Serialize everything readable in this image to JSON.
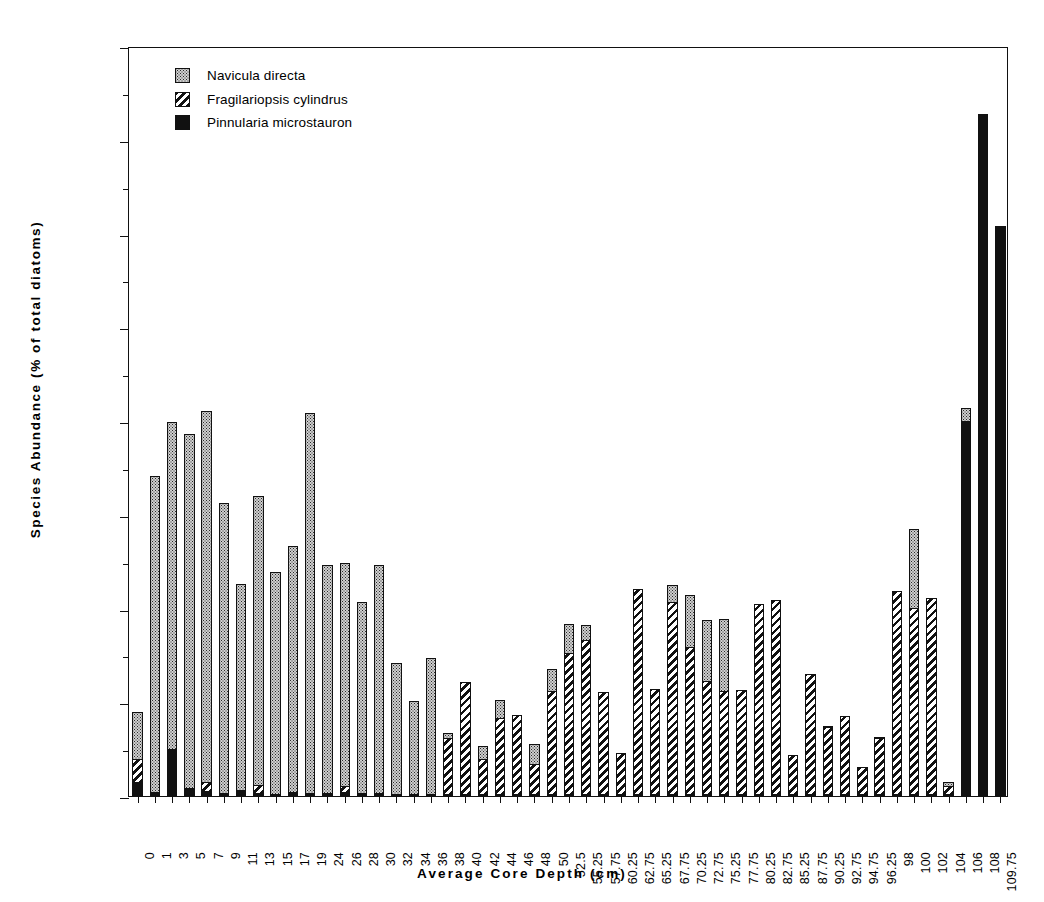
{
  "chart_data": {
    "type": "bar",
    "subtype": "stacked-bar",
    "title": "",
    "xlabel": "Average  Core  Depth  (cm)",
    "ylabel": "Species  Abundance  (%  of  total  diatoms)",
    "ylim": [
      0,
      80
    ],
    "ytick_step": 10,
    "yminor_step": 5,
    "yticks": [
      0,
      10,
      20,
      30,
      40,
      50,
      60,
      70,
      80
    ],
    "ytick_labels": [
      "0",
      "10",
      "20",
      "30",
      "40",
      "50",
      "60",
      "70",
      "80"
    ],
    "grid": false,
    "legend_position": "top-left-inside",
    "categories": [
      "0",
      "1",
      "3",
      "5",
      "7",
      "9",
      "11",
      "13",
      "15",
      "17",
      "19",
      "24",
      "26",
      "28",
      "30",
      "32",
      "34",
      "36",
      "38",
      "40",
      "42",
      "44",
      "46",
      "48",
      "50",
      "52.5",
      "55.25",
      "57.75",
      "60.25",
      "62.75",
      "65.25",
      "67.75",
      "70.25",
      "72.75",
      "75.25",
      "77.75",
      "80.25",
      "82.75",
      "85.25",
      "87.75",
      "90.25",
      "92.75",
      "94.75",
      "96.25",
      "98",
      "100",
      "102",
      "104",
      "106",
      "108",
      "109.75"
    ],
    "series": [
      {
        "name": "Pinnularia microstauron",
        "pattern": "solid-black",
        "color": "#111111",
        "values": [
          1.5,
          0.4,
          5.0,
          0.9,
          0.5,
          0.3,
          0.6,
          0.3,
          0.2,
          0.4,
          0.3,
          0.3,
          0.4,
          0.3,
          0.3,
          0.2,
          0.2,
          0.2,
          0.2,
          0.2,
          0.2,
          0.2,
          0.2,
          0.2,
          0.2,
          0.2,
          0.2,
          0.2,
          0.2,
          0.2,
          0.2,
          0.2,
          0.2,
          0.2,
          0.2,
          0.2,
          0.2,
          0.2,
          0.2,
          0.2,
          0.2,
          0.2,
          0.2,
          0.2,
          0.2,
          0.2,
          0.2,
          0.2,
          40.0,
          72.8,
          60.8
        ]
      },
      {
        "name": "Fragilariopsis cylindrus",
        "pattern": "diagonal-hatch",
        "color": "#111111",
        "values": [
          2.6,
          0.0,
          0.0,
          0.0,
          1.1,
          0.0,
          0.0,
          1.0,
          0.0,
          0.0,
          0.0,
          0.0,
          0.8,
          0.0,
          0.0,
          0.0,
          0.0,
          0.0,
          6.1,
          12.1,
          3.9,
          8.2,
          8.6,
          3.3,
          11.1,
          15.2,
          16.6,
          11.0,
          4.5,
          22.0,
          11.3,
          20.6,
          15.8,
          12.2,
          11.1,
          11.2,
          20.4,
          20.8,
          4.3,
          12.9,
          7.3,
          8.5,
          3.0,
          6.1,
          21.8,
          20.0,
          21.0,
          1.0,
          0.0,
          0.0,
          0.0
        ]
      },
      {
        "name": "Navicula directa",
        "pattern": "stipple-dots",
        "color": "#cfcfcf",
        "values": [
          5.1,
          33.9,
          35.0,
          37.8,
          39.7,
          31.1,
          22.1,
          31.0,
          23.8,
          26.4,
          40.7,
          24.5,
          23.9,
          20.5,
          24.5,
          14.1,
          10.1,
          14.6,
          0.7,
          0.0,
          1.5,
          2.1,
          0.0,
          2.3,
          2.5,
          3.2,
          1.7,
          0.0,
          0.0,
          0.0,
          0.0,
          1.9,
          5.7,
          6.6,
          7.8,
          0.0,
          0.0,
          0.0,
          0.0,
          0.0,
          0.2,
          0.0,
          0.0,
          0.2,
          0.0,
          8.5,
          0.0,
          0.5,
          1.5,
          0.0,
          0.0
        ]
      }
    ],
    "totals": [
      9.2,
      34.3,
      40.0,
      38.7,
      41.3,
      31.4,
      22.7,
      32.3,
      24.0,
      26.8,
      41.0,
      24.8,
      25.1,
      20.8,
      24.8,
      14.3,
      10.3,
      14.8,
      7.0,
      12.3,
      5.6,
      10.5,
      8.8,
      5.8,
      13.8,
      18.6,
      18.5,
      11.2,
      4.7,
      22.2,
      11.5,
      22.7,
      21.7,
      19.0,
      19.1,
      11.4,
      20.6,
      21.0,
      4.5,
      13.1,
      7.7,
      8.7,
      3.2,
      6.5,
      22.0,
      28.7,
      21.2,
      1.7,
      41.5,
      72.8,
      60.8
    ]
  },
  "legend": {
    "items": [
      {
        "label": "Navicula directa",
        "swatch": "navicula"
      },
      {
        "label": "Fragilariopsis cylindrus",
        "swatch": "fragilariopsis"
      },
      {
        "label": "Pinnularia microstauron",
        "swatch": "pinnularia"
      }
    ]
  }
}
